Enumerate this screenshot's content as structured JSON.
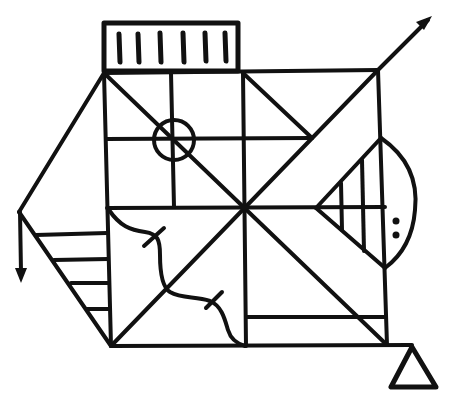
{
  "figure": {
    "title": "",
    "type": "symbolic line diagram",
    "stroke_color": "#111111",
    "background_color": "#ffffff",
    "parts": [
      {
        "name": "top-hatched-box",
        "description": "rectangle on top with six vertical bars",
        "bar_count": 6
      },
      {
        "name": "main-square",
        "description": "central square divided by diagonals and cross lines"
      },
      {
        "name": "circle-cross",
        "description": "small circle with cross in upper-left quadrant"
      },
      {
        "name": "arrow-up-right",
        "description": "diagonal line extending beyond top-right corner ending in arrowhead"
      },
      {
        "name": "left-triangle",
        "description": "triangle to the left of square with four horizontal rungs"
      },
      {
        "name": "arrow-down",
        "description": "vertical arrow pointing down from left apex"
      },
      {
        "name": "right-lens",
        "description": "arc and triangle on right side with vertical hatch lines and two dots",
        "dot_count": 2
      },
      {
        "name": "wavy-line",
        "description": "wavy line with two cross ticks in lower-left quadrant",
        "tick_count": 2
      },
      {
        "name": "bottom-triangle",
        "description": "small outlined triangle below bottom-right corner"
      }
    ]
  }
}
